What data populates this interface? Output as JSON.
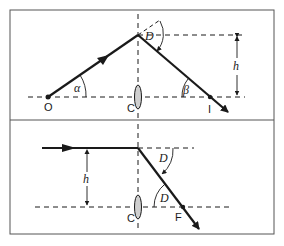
{
  "diagram": {
    "colors": {
      "ink": "#1a1a1a",
      "frame": "#555555",
      "background": "#ffffff"
    },
    "top_panel": {
      "points": {
        "object": "O",
        "lens_center": "C",
        "image": "I"
      },
      "angles": {
        "alpha": "α",
        "beta": "β",
        "deviation": "D"
      },
      "height_label": "h"
    },
    "bottom_panel": {
      "points": {
        "lens_center": "C",
        "focus": "F"
      },
      "angles": {
        "deviation_upper": "D",
        "deviation_lower": "D"
      },
      "height_label": "h"
    }
  }
}
